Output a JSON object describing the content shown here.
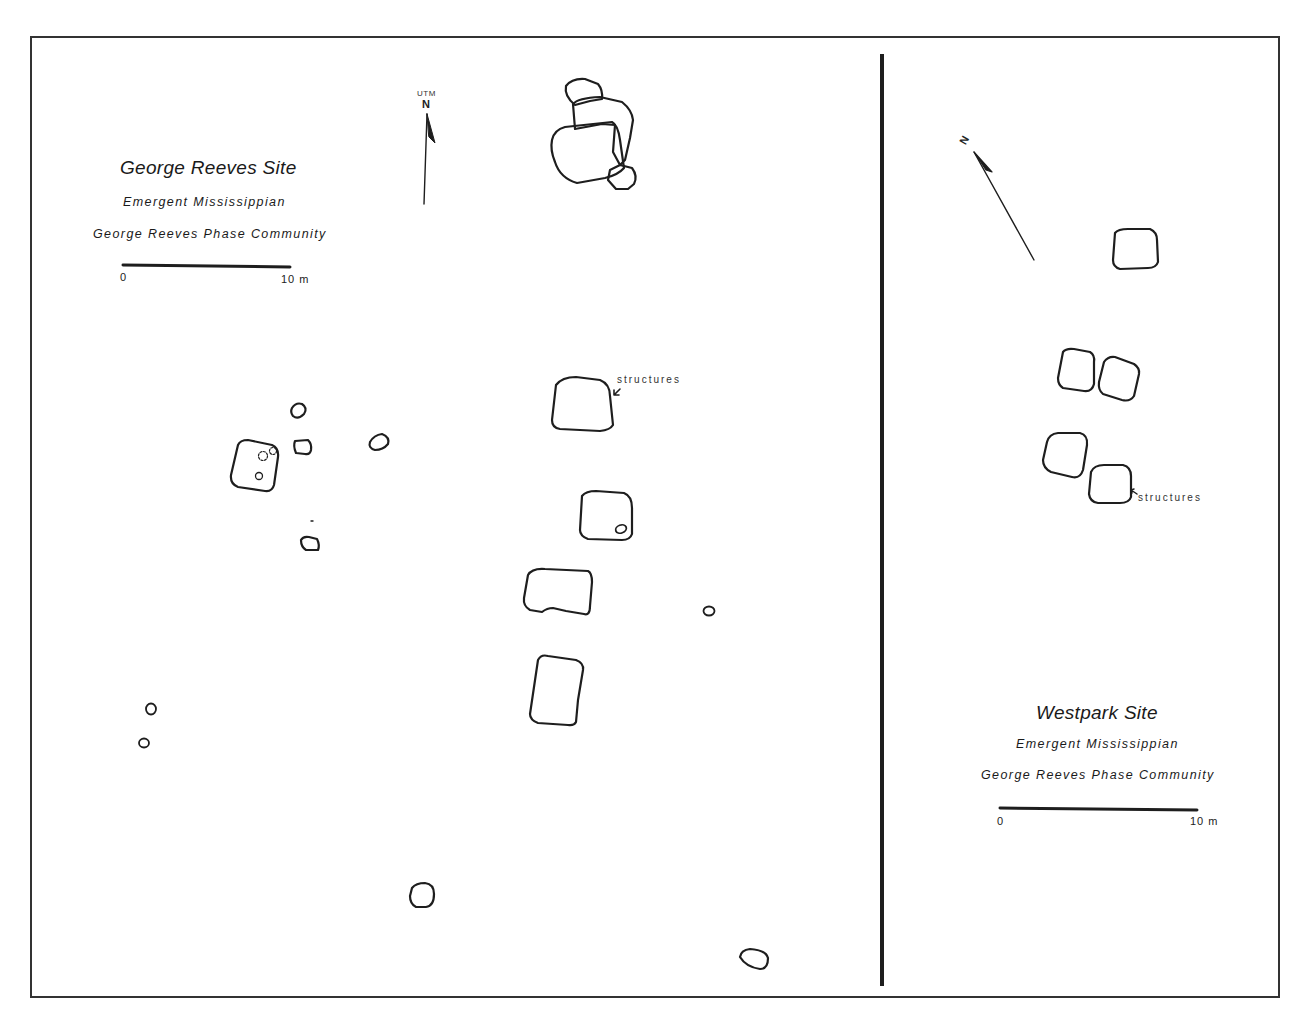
{
  "left_map": {
    "title": "George Reeves Site",
    "subtitle1": "Emergent Mississippian",
    "subtitle2": "George Reeves Phase Community",
    "scale": {
      "start_label": "0",
      "end_label": "10 m"
    },
    "north_arrow": {
      "grid_label": "UTM",
      "direction_label": "N"
    },
    "annotation": "structures"
  },
  "right_map": {
    "title": "Westpark Site",
    "subtitle1": "Emergent Mississippian",
    "subtitle2": "George Reeves Phase Community",
    "scale": {
      "start_label": "0",
      "end_label": "10 m"
    },
    "north_arrow": {
      "direction_label": "N"
    },
    "annotation": "structures"
  },
  "colors": {
    "line": "#1e1e1e",
    "background": "#ffffff",
    "frame": "#333333"
  }
}
